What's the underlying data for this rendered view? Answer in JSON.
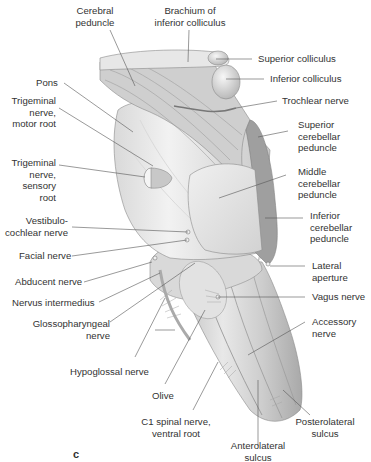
{
  "figure": {
    "panel_letter": "c",
    "labels": {
      "cerebral_peduncle": "Cerebral peduncle",
      "cerebral_peduncle_l1": "Cerebral",
      "cerebral_peduncle_l2": "peduncle",
      "brachium_l1": "Brachium of",
      "brachium_l2": "inferior colliculus",
      "superior_colliculus": "Superior colliculus",
      "inferior_colliculus": "Inferior colliculus",
      "pons": "Pons",
      "trochlear_nerve": "Trochlear nerve",
      "trig_motor_l1": "Trigeminal",
      "trig_motor_l2": "nerve,",
      "trig_motor_l3": "motor root",
      "sup_cb_l1": "Superior",
      "sup_cb_l2": "cerebellar",
      "sup_cb_l3": "peduncle",
      "trig_sensory_l1": "Trigeminal",
      "trig_sensory_l2": "nerve,",
      "trig_sensory_l3": "sensory",
      "trig_sensory_l4": "root",
      "mid_cb_l1": "Middle",
      "mid_cb_l2": "cerebellar",
      "mid_cb_l3": "peduncle",
      "vestibulo_l1": "Vestibulo-",
      "vestibulo_l2": "cochlear nerve",
      "inf_cb_l1": "Inferior",
      "inf_cb_l2": "cerebellar",
      "inf_cb_l3": "peduncle",
      "facial_nerve": "Facial nerve",
      "lateral_aperture_l1": "Lateral",
      "lateral_aperture_l2": "aperture",
      "abducent_nerve": "Abducent nerve",
      "vagus_nerve": "Vagus nerve",
      "nervus_intermedius": "Nervus intermedius",
      "glosso_l1": "Glossopharyngeal",
      "glosso_l2": "nerve",
      "accessory_l1": "Accessory",
      "accessory_l2": "nerve",
      "hypoglossal_nerve": "Hypoglossal nerve",
      "olive": "Olive",
      "c1_l1": "C1 spinal nerve,",
      "c1_l2": "ventral root",
      "posterolateral_l1": "Posterolateral",
      "posterolateral_l2": "sulcus",
      "anterolateral_l1": "Anterolateral",
      "anterolateral_l2": "sulcus"
    },
    "colors": {
      "tissue_light": "#efefef",
      "tissue_mid": "#cfcfcf",
      "tissue_dark": "#9a9a9a",
      "leader_line": "#555555",
      "text": "#333333"
    }
  }
}
